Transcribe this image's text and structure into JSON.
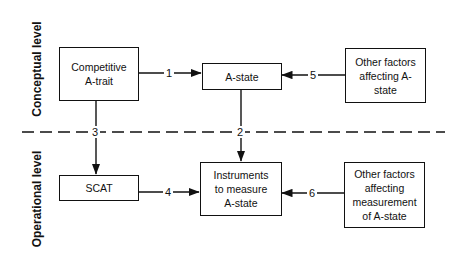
{
  "levels": {
    "conceptual": "Conceptual level",
    "operational": "Operational level"
  },
  "boxes": {
    "competitive_a_trait": "Competitive A-trait",
    "a_state": "A-state",
    "other_factors_a_state": "Other factors affecting A-state",
    "scat": "SCAT",
    "instruments": "Instruments to measure A-state",
    "other_factors_measurement": "Other factors affecting measurement of A-state"
  },
  "links": {
    "l1": "1",
    "l2": "2",
    "l3": "3",
    "l4": "4",
    "l5": "5",
    "l6": "6"
  },
  "colors": {
    "line": "#111111",
    "background": "#ffffff"
  }
}
